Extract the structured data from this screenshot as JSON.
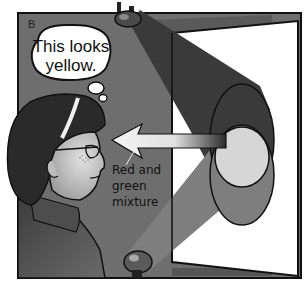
{
  "panel": {
    "label": "B",
    "background_color": "#6e6e6e"
  },
  "thought_bubble": {
    "lines": [
      "This looks",
      "yellow."
    ]
  },
  "annotation": {
    "lines": [
      "Red and",
      "green",
      "mixture"
    ]
  },
  "colors": {
    "wall": "#6e6e6e",
    "screen": "#ffffff",
    "beam_top": "#3a3a3a",
    "beam_bottom": "#7a7a7a",
    "spot_mix": "#d6d6d6",
    "outline": "#111111",
    "hair": "#2a2a2a",
    "skin": "#c8c8c8",
    "sweater": "#555555"
  },
  "icons": {
    "top_lamp": "spotlight-icon",
    "bottom_lamp": "spotlight-icon",
    "arrow": "arrow-left-icon"
  }
}
